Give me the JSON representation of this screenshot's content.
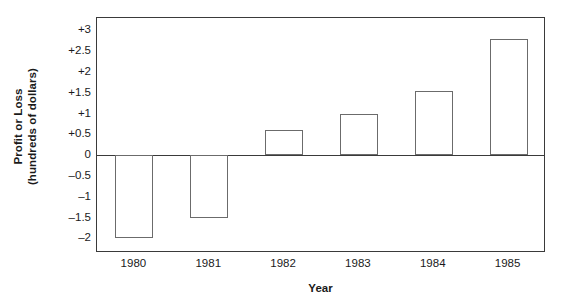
{
  "chart_data": {
    "type": "bar",
    "title": "",
    "xlabel": "Year",
    "ylabel": "Profit or Loss (hundreds of dollars)",
    "ylabel_line1": "Profit or Loss",
    "ylabel_line2": "(hundreds of dollars)",
    "categories": [
      "1980",
      "1981",
      "1982",
      "1983",
      "1984",
      "1985"
    ],
    "values": [
      -2,
      -1.5,
      0.6,
      1,
      1.55,
      2.8
    ],
    "ylim": [
      -2.35,
      3.3
    ],
    "yticks": [
      3,
      2.5,
      2,
      1.5,
      1,
      0.5,
      0,
      -0.5,
      -1,
      -1.5,
      -2
    ],
    "ytick_labels": [
      "+3",
      "+2.5",
      "+2",
      "+1.5",
      "+1",
      "+0.5",
      "0",
      "–0.5",
      "–1",
      "–1.5",
      "–2"
    ],
    "grid": false,
    "legend": false,
    "bar_fill": "#ffffff",
    "bar_edge": "#6b6b6b",
    "axis_color": "#3a3a3a",
    "background": "#ffffff"
  }
}
